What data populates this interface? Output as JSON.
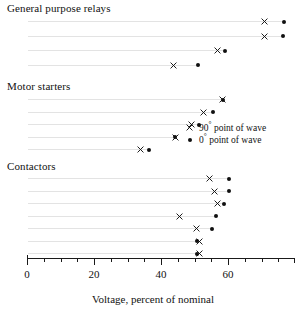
{
  "chart_data": {
    "type": "scatter",
    "title": "",
    "xlabel": "Voltage, percent of nominal",
    "ylabel": "",
    "xlim": [
      0,
      80
    ],
    "xticks_major": [
      0,
      20,
      40,
      60
    ],
    "xtick_labels": [
      "0",
      "20",
      "40",
      "60"
    ],
    "xticks_minor": [
      5,
      10,
      15,
      25,
      30,
      35,
      45,
      50,
      55,
      65,
      70,
      75
    ],
    "grid": "horizontal-light",
    "legend_position": "middle-right",
    "legend": [
      {
        "symbol": "x",
        "label": "90° point of wave"
      },
      {
        "symbol": "dot",
        "label": "0° point of wave"
      }
    ],
    "groups": [
      {
        "name": "General purpose relays",
        "rows": [
          {
            "x90": 70.8,
            "x0": 76.7
          },
          {
            "x90": 70.8,
            "x0": 76.4
          },
          {
            "x90": 57.0,
            "x0": 59.1
          },
          {
            "x90": 43.6,
            "x0": 51.0
          }
        ]
      },
      {
        "name": "Motor starters",
        "rows": [
          {
            "x90": 58.5,
            "x0": 58.5
          },
          {
            "x90": 52.8,
            "x0": 55.5
          },
          {
            "x90": 49.0,
            "x0": 51.3
          },
          {
            "x90": 44.2,
            "x0": 44.2
          },
          {
            "x90": 34.0,
            "x0": 36.5
          }
        ]
      },
      {
        "name": "Contactors",
        "rows": [
          {
            "x90": 54.5,
            "x0": 60.3
          },
          {
            "x90": 56.0,
            "x0": 60.3
          },
          {
            "x90": 57.0,
            "x0": 58.8
          },
          {
            "x90": 45.5,
            "x0": 56.4
          },
          {
            "x90": 50.5,
            "x0": 55.1
          },
          {
            "x90": 51.6,
            "x0": 50.6
          },
          {
            "x90": 51.6,
            "x0": 50.6
          }
        ]
      }
    ],
    "colors": {
      "marker": "#101010",
      "grid": "#e3e3e3",
      "axis": "#1a1a1a"
    }
  },
  "axis": {
    "xlabel": "Voltage, percent of nominal",
    "tick_labels": [
      "0",
      "20",
      "40",
      "60"
    ]
  },
  "legend": {
    "item90": "90° point of wave",
    "item0": "0° point of wave"
  },
  "groups": {
    "g0_title": "General purpose relays",
    "g1_title": "Motor starters",
    "g2_title": "Contactors"
  }
}
